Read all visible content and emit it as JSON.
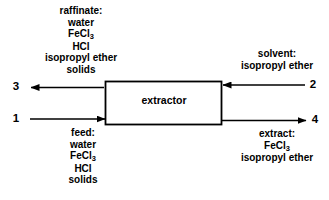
{
  "diagram": {
    "type": "process-flow-diagram",
    "unit": {
      "name": "extractor",
      "label": "extractor"
    },
    "streams": [
      {
        "number": "1",
        "role": "feed",
        "direction": "into-unit",
        "side": "left",
        "title": "feed:",
        "components": [
          "water",
          "FeCl3",
          "HCl",
          "solids"
        ],
        "components_display": [
          "water",
          "FeCl",
          "HCl",
          "solids"
        ],
        "label_position": "below"
      },
      {
        "number": "2",
        "role": "solvent",
        "direction": "into-unit",
        "side": "right",
        "title": "solvent:",
        "components": [
          "isopropyl ether"
        ],
        "label_position": "above"
      },
      {
        "number": "3",
        "role": "raffinate",
        "direction": "out-of-unit",
        "side": "left",
        "title": "raffinate:",
        "components": [
          "water",
          "FeCl3",
          "HCl",
          "isopropyl ether",
          "solids"
        ],
        "label_position": "above"
      },
      {
        "number": "4",
        "role": "extract",
        "direction": "out-of-unit",
        "side": "right",
        "title": "extract:",
        "components": [
          "FeCl3",
          "isopropyl ether"
        ],
        "label_position": "below"
      }
    ],
    "text": {
      "raffinate_title": "raffinate:",
      "raffinate_l1": "water",
      "raffinate_l2_base": "FeCl",
      "raffinate_l2_sub": "3",
      "raffinate_l3": "HCl",
      "raffinate_l4": "isopropyl ether",
      "raffinate_l5": "solids",
      "feed_title": "feed:",
      "feed_l1": "water",
      "feed_l2_base": "FeCl",
      "feed_l2_sub": "3",
      "feed_l3": "HCl",
      "feed_l4": "solids",
      "solvent_title": "solvent:",
      "solvent_l1": "isopropyl ether",
      "extract_title": "extract:",
      "extract_l1_base": "FeCl",
      "extract_l1_sub": "3",
      "extract_l2": "isopropyl ether",
      "unit_label": "extractor",
      "num1": "1",
      "num2": "2",
      "num3": "3",
      "num4": "4"
    },
    "colors": {
      "line": "#000000",
      "text": "#000000",
      "background": "#ffffff"
    }
  }
}
